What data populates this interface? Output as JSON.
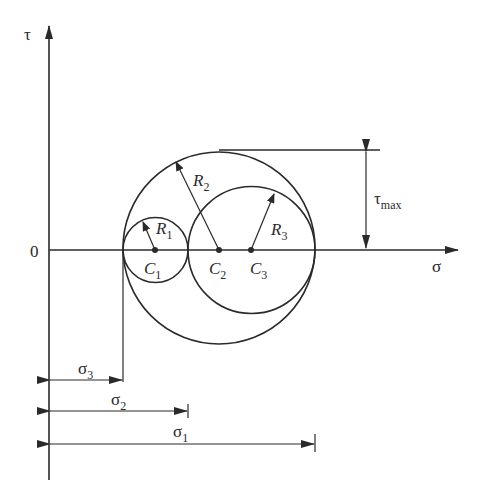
{
  "figure": {
    "axes": {
      "vertical_label": "τ",
      "horizontal_label": "σ",
      "origin_label": "0"
    },
    "circles": [
      {
        "center_label": "C",
        "center_sub": "1",
        "radius_label": "R",
        "radius_sub": "1"
      },
      {
        "center_label": "C",
        "center_sub": "2",
        "radius_label": "R",
        "radius_sub": "2"
      },
      {
        "center_label": "C",
        "center_sub": "3",
        "radius_label": "R",
        "radius_sub": "3"
      }
    ],
    "tau_max": {
      "label": "τ",
      "sub": "max"
    },
    "dimensions": [
      {
        "label": "σ",
        "sub": "3"
      },
      {
        "label": "σ",
        "sub": "2"
      },
      {
        "label": "σ",
        "sub": "1"
      }
    ]
  }
}
